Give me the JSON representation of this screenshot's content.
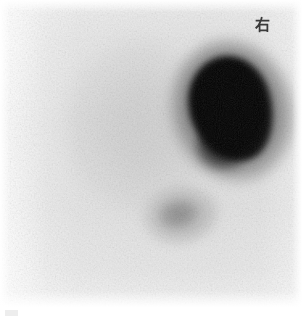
{
  "viewer": {
    "name": "nuclear-medicine-scintigram-viewer",
    "width": 302,
    "height": 319,
    "background_color": "#ffffff"
  },
  "scan": {
    "modality_label": "scintigram",
    "field_top": 0,
    "field_height": 307,
    "background_color": "#e5e5e5",
    "paper_color": "#ffffff",
    "max_uptake_color": "#000000",
    "colormap": "inverted-greyscale",
    "noise_texture": "poisson-counting-noise"
  },
  "annotations": {
    "orientation_marker": {
      "text": "右",
      "meaning": "right",
      "color": "#3a3a3a",
      "x": 252,
      "y": 14
    },
    "footer_tag": {
      "text": "",
      "color": "#ededed"
    },
    "footer_label": {
      "text": "",
      "color": "#ececec"
    }
  },
  "findings": [
    {
      "id": "focus-primary",
      "label": "intense focal uptake",
      "intensity": "very high",
      "intensity_color": "#000000",
      "x": 190,
      "y": 56,
      "width": 82,
      "height": 106,
      "shape": "ovoid",
      "rotation_deg": -15
    },
    {
      "id": "focus-secondary",
      "label": "faint focal uptake",
      "intensity": "low",
      "intensity_color": "#b4b4b4",
      "x": 158,
      "y": 200,
      "width": 40,
      "height": 28,
      "shape": "irregular",
      "rotation_deg": -12
    },
    {
      "id": "diffuse-blush",
      "label": "diffuse soft tissue background",
      "intensity": "very low",
      "intensity_color": "#dedede",
      "x": 64,
      "y": 40,
      "width": 150,
      "height": 170,
      "shape": "ellipse",
      "rotation_deg": 0
    }
  ]
}
